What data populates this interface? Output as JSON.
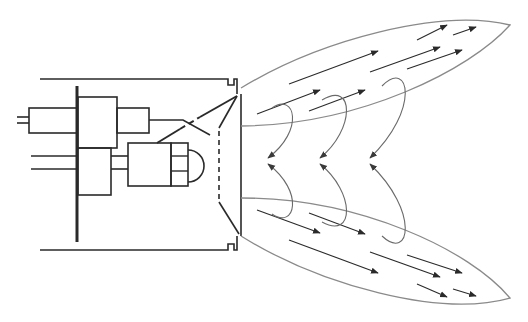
{
  "diagram": {
    "title": "",
    "colors": {
      "line_dark": "#2a2a2a",
      "line_gray": "#8a8a8a",
      "background": "#ffffff"
    },
    "components": [
      {
        "id": "housing",
        "label": ""
      },
      {
        "id": "mounting-plate",
        "label": ""
      },
      {
        "id": "connector-block",
        "label": ""
      },
      {
        "id": "upper-module",
        "label": ""
      },
      {
        "id": "lower-module",
        "label": ""
      },
      {
        "id": "lamp-unit",
        "label": ""
      },
      {
        "id": "reflector-window",
        "label": ""
      },
      {
        "id": "upper-lobe",
        "label": ""
      },
      {
        "id": "lower-lobe",
        "label": ""
      }
    ],
    "arrow_counts": {
      "upper_lobe_straight": 8,
      "lower_lobe_straight": 8,
      "curved_recirculation": 6
    }
  }
}
